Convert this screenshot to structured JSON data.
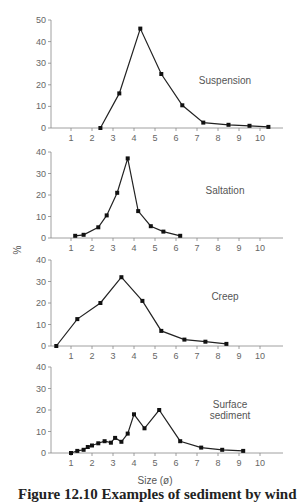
{
  "figure": {
    "ylabel": "%",
    "xlabel": "Size (ø)",
    "caption": "Figure 12.10   Examples of sediment by wind"
  },
  "chart_data": [
    {
      "type": "line",
      "title": "Suspension",
      "xlabel": "Size (ø)",
      "ylabel": "%",
      "xticks": [
        1,
        2,
        3,
        4,
        5,
        6,
        7,
        8,
        9,
        10
      ],
      "yticks": [
        0,
        10,
        20,
        30,
        40,
        50
      ],
      "ylim": [
        0,
        50
      ],
      "xlim": [
        0,
        11
      ],
      "grid": false,
      "x": [
        2.4,
        3.3,
        4.3,
        5.3,
        6.3,
        7.3,
        8.5,
        9.5,
        10.4
      ],
      "y": [
        0,
        16,
        46,
        25,
        10.5,
        2.5,
        1.5,
        1,
        0.5
      ]
    },
    {
      "type": "line",
      "title": "Saltation",
      "xlabel": "Size (ø)",
      "ylabel": "%",
      "xticks": [
        1,
        2,
        3,
        4,
        5,
        6,
        7,
        8,
        9,
        10
      ],
      "yticks": [
        0,
        10,
        20,
        30,
        40
      ],
      "ylim": [
        0,
        40
      ],
      "xlim": [
        0,
        11
      ],
      "grid": false,
      "x": [
        1.2,
        1.6,
        2.3,
        2.7,
        3.2,
        3.7,
        4.2,
        4.8,
        5.4,
        6.2
      ],
      "y": [
        1,
        1.5,
        5,
        10.5,
        21,
        37,
        12.5,
        5.5,
        3,
        1
      ]
    },
    {
      "type": "line",
      "title": "Creep",
      "xlabel": "Size (ø)",
      "ylabel": "%",
      "xticks": [
        1,
        2,
        3,
        4,
        5,
        6,
        7,
        8,
        9,
        10
      ],
      "yticks": [
        0,
        10,
        20,
        30,
        40
      ],
      "ylim": [
        0,
        40
      ],
      "xlim": [
        0,
        11
      ],
      "grid": false,
      "x": [
        0.3,
        1.3,
        2.4,
        3.4,
        4.4,
        5.3,
        6.4,
        7.4,
        8.4
      ],
      "y": [
        0,
        12.5,
        20,
        32,
        21,
        7,
        3,
        2,
        1
      ]
    },
    {
      "type": "line",
      "title": "Surface sediment",
      "xlabel": "Size (ø)",
      "ylabel": "%",
      "xticks": [
        1,
        2,
        3,
        4,
        5,
        6,
        7,
        8,
        9,
        10
      ],
      "yticks": [
        0,
        10,
        20,
        30,
        40
      ],
      "ylim": [
        0,
        40
      ],
      "xlim": [
        0,
        11
      ],
      "grid": false,
      "x": [
        1.0,
        1.3,
        1.6,
        1.8,
        2.0,
        2.3,
        2.6,
        2.9,
        3.1,
        3.4,
        3.7,
        4.0,
        4.5,
        5.2,
        6.2,
        7.2,
        8.2,
        9.2
      ],
      "y": [
        0,
        1,
        1.5,
        2.8,
        3.5,
        4.5,
        5.5,
        4.8,
        7,
        5.2,
        9,
        18,
        11.5,
        20,
        5.5,
        2.5,
        1.5,
        1
      ],
      "label_lines": [
        "Surface",
        "sediment"
      ]
    }
  ],
  "layout": {
    "panels": [
      {
        "top": 20,
        "bottom": 128,
        "label_x": 225,
        "label_y": 84
      },
      {
        "top": 152,
        "bottom": 238,
        "label_x": 225,
        "label_y": 194
      },
      {
        "top": 260,
        "bottom": 346,
        "label_x": 225,
        "label_y": 300
      },
      {
        "top": 367,
        "bottom": 453,
        "label_x": 230,
        "label_y": 408
      }
    ],
    "x_axis_left": 51,
    "x_axis_right": 283,
    "x_origin_px": 50,
    "x_unit_px": 21
  }
}
